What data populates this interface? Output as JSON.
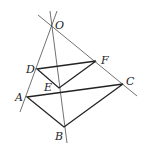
{
  "figure": {
    "points": {
      "O": {
        "label": "O",
        "x": 52,
        "y": 25
      },
      "D": {
        "label": "D",
        "x": 37,
        "y": 69
      },
      "F": {
        "label": "F",
        "x": 96,
        "y": 61
      },
      "E": {
        "label": "E",
        "x": 59,
        "y": 88
      },
      "A": {
        "label": "A",
        "x": 27,
        "y": 97
      },
      "C": {
        "label": "C",
        "x": 123,
        "y": 84
      },
      "B": {
        "label": "B",
        "x": 64,
        "y": 127
      }
    },
    "rays": [
      {
        "name": "ray-OA",
        "from": "O",
        "through": "A"
      },
      {
        "name": "ray-OB",
        "from": "O",
        "through": "B"
      },
      {
        "name": "ray-OC",
        "from": "O",
        "through": "C"
      }
    ],
    "triangles": [
      {
        "name": "triangle-DEF",
        "vertices": [
          "D",
          "E",
          "F"
        ]
      },
      {
        "name": "triangle-ABC",
        "vertices": [
          "A",
          "B",
          "C"
        ]
      }
    ]
  }
}
